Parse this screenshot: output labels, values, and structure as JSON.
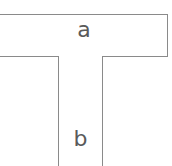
{
  "diagram": {
    "top_block": {
      "label": "a"
    },
    "stem_block": {
      "label": "b"
    },
    "colors": {
      "stroke": "#8a8a8a",
      "text": "#5a5a5a",
      "background": "#ffffff"
    }
  }
}
